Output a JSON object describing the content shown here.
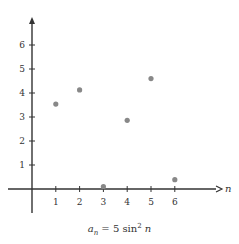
{
  "chart_data": {
    "type": "scatter",
    "title": "",
    "caption": "a_n = 5 sin^2 n",
    "xlabel": "n",
    "ylabel": "",
    "x": [
      1,
      2,
      3,
      4,
      5,
      6
    ],
    "values": [
      3.54,
      4.13,
      0.1,
      2.86,
      4.6,
      0.39
    ],
    "x_ticks": [
      "1",
      "2",
      "3",
      "4",
      "5",
      "6"
    ],
    "y_ticks": [
      "1",
      "2",
      "3",
      "4",
      "5",
      "6"
    ],
    "xlim": [
      -1,
      7.5
    ],
    "ylim": [
      -1.5,
      7
    ],
    "grid": false,
    "point_color": "#888888",
    "axis_color": "#333333"
  },
  "caption": {
    "a": "a",
    "sub": "n",
    "mid": " = 5 sin",
    "sup": "2",
    "end": " n"
  }
}
